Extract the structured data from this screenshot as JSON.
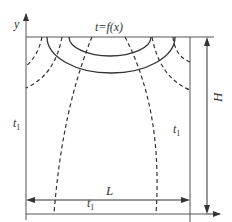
{
  "diagram": {
    "type": "heat-conduction-domain",
    "boundary_top_label": "t=f(x)",
    "left_boundary_label": "t",
    "left_boundary_subscript": "1",
    "right_boundary_label": "t",
    "right_boundary_subscript": "1",
    "bottom_boundary_label": "t",
    "bottom_boundary_subscript": "1",
    "width_label": "L",
    "height_label": "H",
    "x_axis_label": "x",
    "y_axis_label": "y",
    "legend": {
      "solid_lines": "isotherms",
      "dashed_lines": "heat flux lines"
    },
    "colors": {
      "line": "#333333",
      "frame": "#555555",
      "background": "#ffffff"
    }
  }
}
